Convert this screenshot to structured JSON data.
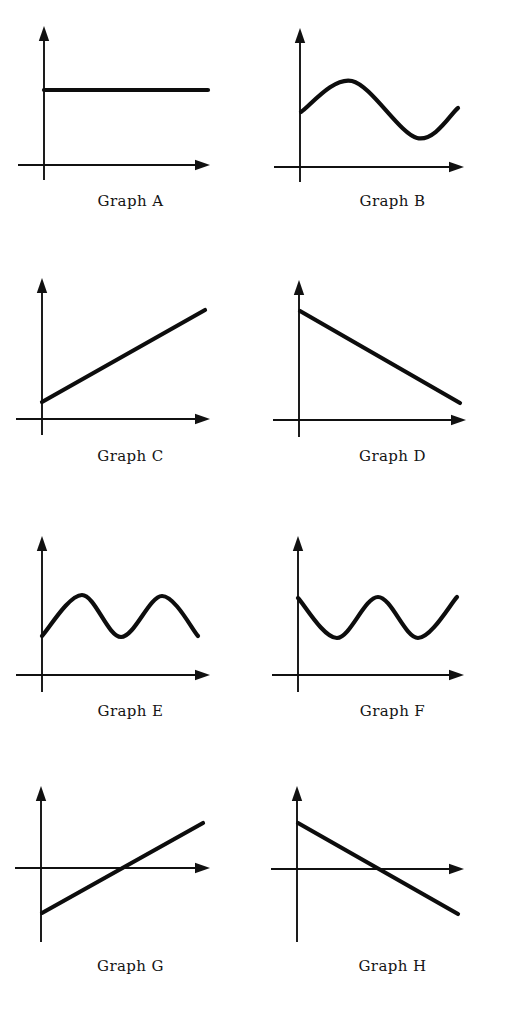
{
  "sheet": {
    "background_color": "#ffffff",
    "ink_color": "#111111",
    "width": 523,
    "height": 1017,
    "columns": 2,
    "rows": 4
  },
  "panels": [
    {
      "id": "graph-a",
      "caption": "Graph A",
      "caption_top": 192,
      "panel_left": 0,
      "panel_top": 0,
      "origin": {
        "x": 44,
        "y": 165
      },
      "y_axis_top": 28,
      "y_axis_bottom": 180,
      "x_axis_left": 18,
      "x_axis_right": 208,
      "curve_type": "constant",
      "description": "horizontal constant line above the x-axis",
      "points": [
        [
          44,
          90
        ],
        [
          208,
          90
        ]
      ]
    },
    {
      "id": "graph-b",
      "caption": "Graph B",
      "caption_top": 192,
      "panel_left": 262,
      "panel_top": 0,
      "origin": {
        "x": 38,
        "y": 167
      },
      "y_axis_top": 30,
      "y_axis_bottom": 182,
      "x_axis_left": 12,
      "x_axis_right": 200,
      "curve_type": "sine-one-cycle",
      "description": "rises to a peak, falls to a trough, then rises again",
      "points": [
        [
          39,
          112
        ],
        [
          90,
          81
        ],
        [
          155,
          138
        ],
        [
          196,
          108
        ]
      ]
    },
    {
      "id": "graph-c",
      "caption": "Graph C",
      "caption_top": 447,
      "panel_left": 0,
      "panel_top": 255,
      "origin": {
        "x": 42,
        "y": 164
      },
      "y_axis_top": 25,
      "y_axis_bottom": 180,
      "x_axis_left": 16,
      "x_axis_right": 208,
      "curve_type": "line-increasing",
      "description": "straight increasing line with small positive intercept",
      "points": [
        [
          42,
          147
        ],
        [
          205,
          55
        ]
      ]
    },
    {
      "id": "graph-d",
      "caption": "Graph D",
      "caption_top": 447,
      "panel_left": 262,
      "panel_top": 255,
      "origin": {
        "x": 37,
        "y": 165
      },
      "y_axis_top": 27,
      "y_axis_bottom": 182,
      "x_axis_left": 11,
      "x_axis_right": 202,
      "curve_type": "line-decreasing",
      "description": "straight decreasing line from a high intercept toward the axis",
      "points": [
        [
          38,
          56
        ],
        [
          198,
          148
        ]
      ]
    },
    {
      "id": "graph-e",
      "caption": "Graph E",
      "caption_top": 702,
      "panel_left": 0,
      "panel_top": 510,
      "origin": {
        "x": 42,
        "y": 165
      },
      "y_axis_top": 28,
      "y_axis_bottom": 182,
      "x_axis_left": 16,
      "x_axis_right": 208,
      "curve_type": "sine-two-cycle-trough-start",
      "description": "two-hump wave starting low at the axis, entirely above the x-axis",
      "points": [
        [
          42,
          126
        ],
        [
          82,
          85
        ],
        [
          121,
          127
        ],
        [
          162,
          86
        ],
        [
          198,
          126
        ]
      ]
    },
    {
      "id": "graph-f",
      "caption": "Graph F",
      "caption_top": 702,
      "panel_left": 262,
      "panel_top": 510,
      "origin": {
        "x": 36,
        "y": 165
      },
      "y_axis_top": 28,
      "y_axis_bottom": 182,
      "x_axis_left": 10,
      "x_axis_right": 200,
      "curve_type": "sine-two-cycle-peak-start",
      "description": "wave starting high at the axis, dipping and rising twice",
      "points": [
        [
          36,
          88
        ],
        [
          75,
          128
        ],
        [
          116,
          87
        ],
        [
          156,
          128
        ],
        [
          195,
          87
        ]
      ]
    },
    {
      "id": "graph-g",
      "caption": "Graph G",
      "caption_top": 957,
      "panel_left": 0,
      "panel_top": 762,
      "origin": {
        "x": 41,
        "y": 106
      },
      "y_axis_top": 26,
      "y_axis_bottom": 180,
      "x_axis_left": 15,
      "x_axis_right": 208,
      "curve_type": "line-increasing-crossing",
      "description": "increasing line with negative intercept crossing the x-axis",
      "points": [
        [
          42,
          151
        ],
        [
          203,
          61
        ]
      ],
      "x_intercept": 123
    },
    {
      "id": "graph-h",
      "caption": "Graph H",
      "caption_top": 957,
      "panel_left": 262,
      "panel_top": 762,
      "origin": {
        "x": 35,
        "y": 107
      },
      "y_axis_top": 26,
      "y_axis_bottom": 180,
      "x_axis_left": 9,
      "x_axis_right": 200,
      "curve_type": "line-decreasing-crossing",
      "description": "decreasing line with positive intercept crossing the x-axis",
      "points": [
        [
          36,
          61
        ],
        [
          196,
          152
        ]
      ],
      "x_intercept": 116
    }
  ],
  "chart_data": {
    "type": "line",
    "title": "",
    "xlabel": "",
    "ylabel": "",
    "grid": false,
    "legend": "none",
    "panel_labels": [
      "Graph A",
      "Graph B",
      "Graph C",
      "Graph D",
      "Graph E",
      "Graph F",
      "Graph G",
      "Graph H"
    ],
    "series": [
      {
        "name": "Graph A",
        "shape": "constant",
        "x": [
          0,
          1,
          2,
          3,
          4,
          5,
          6,
          7,
          8,
          9,
          10
        ],
        "y": [
          1.6,
          1.6,
          1.6,
          1.6,
          1.6,
          1.6,
          1.6,
          1.6,
          1.6,
          1.6,
          1.6
        ],
        "xlim": [
          0,
          10
        ],
        "ylim": [
          0,
          3
        ]
      },
      {
        "name": "Graph B",
        "shape": "sine one cycle",
        "x": [
          0,
          1,
          2,
          3,
          4,
          5,
          6,
          7,
          8,
          9,
          10
        ],
        "y": [
          1.3,
          1.75,
          2.1,
          2.15,
          1.85,
          1.35,
          0.95,
          0.8,
          0.9,
          1.15,
          1.4
        ],
        "xlim": [
          0,
          10
        ],
        "ylim": [
          0,
          3
        ]
      },
      {
        "name": "Graph C",
        "shape": "linear increasing",
        "x": [
          0,
          1,
          2,
          3,
          4,
          5,
          6,
          7,
          8,
          9,
          10
        ],
        "y": [
          0.3,
          0.47,
          0.64,
          0.81,
          0.98,
          1.15,
          1.32,
          1.49,
          1.66,
          1.83,
          2.0
        ],
        "xlim": [
          0,
          10
        ],
        "ylim": [
          0,
          3
        ]
      },
      {
        "name": "Graph D",
        "shape": "linear decreasing",
        "x": [
          0,
          1,
          2,
          3,
          4,
          5,
          6,
          7,
          8,
          9,
          10
        ],
        "y": [
          2.1,
          1.93,
          1.76,
          1.59,
          1.42,
          1.25,
          1.08,
          0.91,
          0.74,
          0.57,
          0.4
        ],
        "xlim": [
          0,
          10
        ],
        "ylim": [
          0,
          3
        ]
      },
      {
        "name": "Graph E",
        "shape": "sine two cycles starting at minimum",
        "x": [
          0,
          1,
          2,
          3,
          4,
          5,
          6,
          7,
          8,
          9,
          10
        ],
        "y": [
          0.9,
          1.3,
          1.7,
          1.45,
          0.95,
          0.88,
          1.3,
          1.7,
          1.45,
          1.0,
          0.9
        ],
        "xlim": [
          0,
          10
        ],
        "ylim": [
          0,
          3
        ]
      },
      {
        "name": "Graph F",
        "shape": "cosine two cycles starting at maximum",
        "x": [
          0,
          1,
          2,
          3,
          4,
          5,
          6,
          7,
          8,
          9,
          10
        ],
        "y": [
          1.7,
          1.3,
          0.9,
          1.2,
          1.65,
          1.7,
          1.3,
          0.9,
          1.2,
          1.6,
          1.7
        ],
        "xlim": [
          0,
          10
        ],
        "ylim": [
          0,
          3
        ]
      },
      {
        "name": "Graph G",
        "shape": "linear increasing through zero",
        "x": [
          0,
          1,
          2,
          3,
          4,
          5,
          6,
          7,
          8,
          9,
          10
        ],
        "y": [
          -0.9,
          -0.71,
          -0.52,
          -0.33,
          -0.14,
          0.05,
          0.24,
          0.43,
          0.62,
          0.81,
          1.0
        ],
        "xlim": [
          0,
          10
        ],
        "ylim": [
          -1.5,
          1.5
        ]
      },
      {
        "name": "Graph H",
        "shape": "linear decreasing through zero",
        "x": [
          0,
          1,
          2,
          3,
          4,
          5,
          6,
          7,
          8,
          9,
          10
        ],
        "y": [
          0.95,
          0.76,
          0.57,
          0.38,
          0.19,
          0.0,
          -0.19,
          -0.38,
          -0.57,
          -0.76,
          -0.95
        ],
        "xlim": [
          0,
          10
        ],
        "ylim": [
          -1.5,
          1.5
        ]
      }
    ]
  }
}
